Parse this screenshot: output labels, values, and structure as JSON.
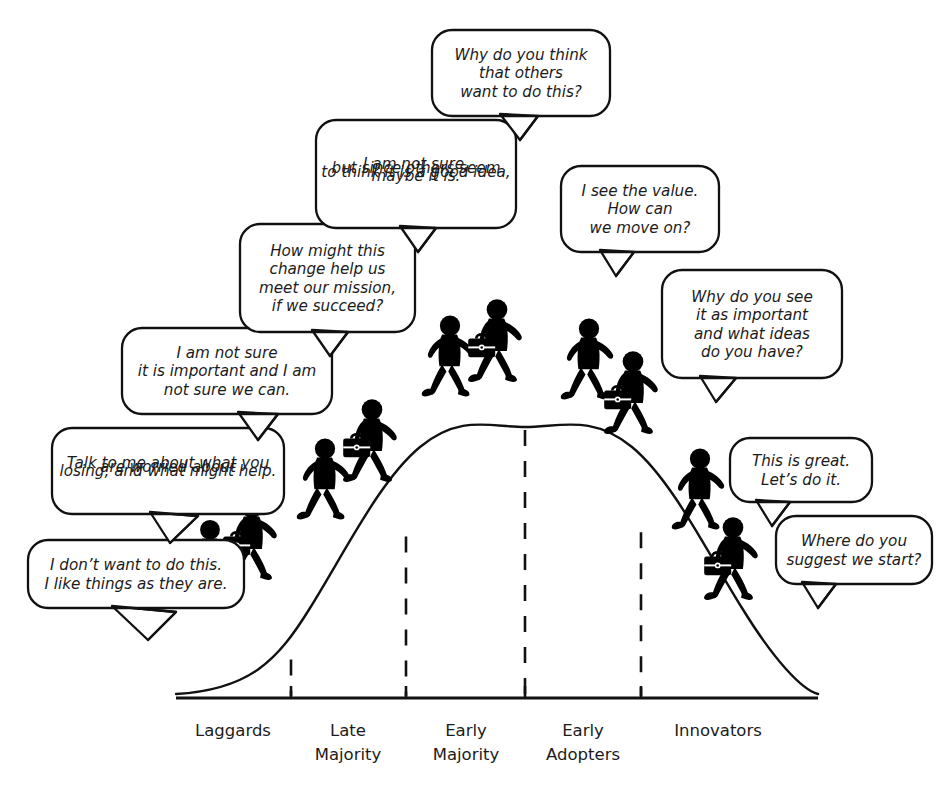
{
  "diagram": {
    "type": "bell-curve-annotated",
    "colors": {
      "background": "#ffffff",
      "ink": "#111111",
      "figure": "#000000",
      "bubble_fill": "#ffffff"
    }
  },
  "axis": {
    "categories": [
      {
        "id": "laggards",
        "line1": "Laggards",
        "line2": "",
        "x": 233
      },
      {
        "id": "late-majority",
        "line1": "Late",
        "line2": "Majority",
        "x": 348
      },
      {
        "id": "early-majority",
        "line1": "Early",
        "line2": "Majority",
        "x": 466
      },
      {
        "id": "early-adopters",
        "line1": "Early",
        "line2": "Adopters",
        "x": 583
      },
      {
        "id": "innovators",
        "line1": "Innovators",
        "line2": "",
        "x": 718
      }
    ],
    "dividers": [
      291,
      406,
      525,
      641
    ],
    "baseline_y": 698,
    "baseline_x_start": 176,
    "baseline_x_end": 818
  },
  "chart_data": {
    "type": "area",
    "xlabel": "",
    "ylabel": "",
    "categories": [
      "Laggards",
      "Late Majority",
      "Early Majority",
      "Early Adopters",
      "Innovators"
    ],
    "curve_peak": {
      "x": 525,
      "y": 427
    },
    "grid": false,
    "legend": "none",
    "note": "Normal distribution bell curve segmented by five adopter categories, read right-to-left from Innovators to Laggards."
  },
  "bubbles": [
    {
      "id": "laggard-resistance",
      "speaker": "laggard",
      "lines": [
        "I don’t want to do this.",
        "I like things as they are."
      ],
      "box": {
        "x": 28,
        "y": 540,
        "w": 216,
        "h": 68,
        "r": 20
      },
      "tail": [
        [
          112,
          606
        ],
        [
          176,
          612
        ],
        [
          148,
          640
        ]
      ]
    },
    {
      "id": "coach-talk-to-me",
      "speaker": "coach",
      "lines": [
        "Talk to me about what you",
        "are worried about",
        "losing, and what might help."
      ],
      "box": {
        "x": 52,
        "y": 428,
        "w": 232,
        "h": 86,
        "r": 20
      },
      "tail": [
        [
          150,
          512
        ],
        [
          198,
          516
        ],
        [
          170,
          543
        ]
      ]
    },
    {
      "id": "late-majority-doubt",
      "speaker": "late-majority",
      "lines": [
        "I am not sure",
        "it is important and I am",
        "not sure we can."
      ],
      "box": {
        "x": 122,
        "y": 328,
        "w": 210,
        "h": 86,
        "r": 20
      },
      "tail": [
        [
          238,
          412
        ],
        [
          278,
          414
        ],
        [
          258,
          440
        ]
      ]
    },
    {
      "id": "coach-how-might-this",
      "speaker": "coach",
      "lines": [
        "How might this",
        "change help us",
        "meet our mission,",
        "if we succeed?"
      ],
      "box": {
        "x": 240,
        "y": 224,
        "w": 175,
        "h": 108,
        "r": 20
      },
      "tail": [
        [
          312,
          330
        ],
        [
          348,
          332
        ],
        [
          330,
          356
        ]
      ]
    },
    {
      "id": "early-majority-maybe",
      "speaker": "early-majority",
      "lines": [
        "I am not sure,",
        "but since others seem",
        "to think it is a good idea,",
        "maybe it is."
      ],
      "box": {
        "x": 316,
        "y": 120,
        "w": 200,
        "h": 108,
        "r": 20
      },
      "tail": [
        [
          400,
          226
        ],
        [
          436,
          228
        ],
        [
          418,
          252
        ]
      ]
    },
    {
      "id": "coach-why-do-others",
      "speaker": "coach",
      "lines": [
        "Why do you think",
        "that others",
        "want to do this?"
      ],
      "box": {
        "x": 432,
        "y": 30,
        "w": 178,
        "h": 86,
        "r": 20
      },
      "tail": [
        [
          500,
          114
        ],
        [
          538,
          116
        ],
        [
          520,
          140
        ]
      ]
    },
    {
      "id": "early-adopter-value",
      "speaker": "early-adopter",
      "lines": [
        "I see the value.",
        "How can",
        "we move on?"
      ],
      "box": {
        "x": 561,
        "y": 166,
        "w": 158,
        "h": 86,
        "r": 20
      },
      "tail": [
        [
          600,
          250
        ],
        [
          634,
          252
        ],
        [
          616,
          276
        ]
      ]
    },
    {
      "id": "coach-why-important",
      "speaker": "coach",
      "lines": [
        "Why do you see",
        "it as important",
        "and what ideas",
        "do you have?"
      ],
      "box": {
        "x": 662,
        "y": 270,
        "w": 180,
        "h": 108,
        "r": 20
      },
      "tail": [
        [
          700,
          376
        ],
        [
          736,
          378
        ],
        [
          716,
          402
        ]
      ]
    },
    {
      "id": "innovator-great",
      "speaker": "innovator",
      "lines": [
        "This is great.",
        "Let’s do it."
      ],
      "box": {
        "x": 730,
        "y": 438,
        "w": 142,
        "h": 64,
        "r": 20
      },
      "tail": [
        [
          756,
          500
        ],
        [
          790,
          502
        ],
        [
          772,
          526
        ]
      ]
    },
    {
      "id": "coach-where-start",
      "speaker": "coach",
      "lines": [
        "Where do you",
        "suggest we start?"
      ],
      "box": {
        "x": 776,
        "y": 516,
        "w": 156,
        "h": 68,
        "r": 20
      },
      "tail": [
        [
          802,
          582
        ],
        [
          836,
          584
        ],
        [
          818,
          608
        ]
      ]
    }
  ],
  "figures": [
    {
      "id": "laggard-person",
      "role": "adopter-plain",
      "x": 210,
      "y": 578,
      "scale": 0.86,
      "rotate": 0,
      "briefcase": false
    },
    {
      "id": "laggard-coach",
      "role": "coach-briefcase",
      "x": 252,
      "y": 558,
      "scale": 0.9,
      "rotate": 0,
      "briefcase": true
    },
    {
      "id": "late-majority-person",
      "role": "adopter-plain",
      "x": 325,
      "y": 498,
      "scale": 0.88,
      "rotate": 0,
      "briefcase": false
    },
    {
      "id": "late-majority-coach",
      "role": "coach-briefcase",
      "x": 372,
      "y": 460,
      "scale": 0.9,
      "rotate": 0,
      "briefcase": true
    },
    {
      "id": "early-majority-person",
      "role": "adopter-plain",
      "x": 450,
      "y": 375,
      "scale": 0.88,
      "rotate": 0,
      "briefcase": false
    },
    {
      "id": "early-majority-coach",
      "role": "coach-briefcase",
      "x": 497,
      "y": 360,
      "scale": 0.9,
      "rotate": 0,
      "briefcase": true
    },
    {
      "id": "early-adopter-person",
      "role": "adopter-plain",
      "x": 589,
      "y": 378,
      "scale": 0.88,
      "rotate": 0,
      "briefcase": false
    },
    {
      "id": "early-adopter-coach",
      "role": "coach-briefcase",
      "x": 633,
      "y": 412,
      "scale": 0.9,
      "rotate": 0,
      "briefcase": true
    },
    {
      "id": "innovator-person",
      "role": "adopter-plain",
      "x": 700,
      "y": 508,
      "scale": 0.88,
      "rotate": 0,
      "briefcase": false
    },
    {
      "id": "innovator-coach",
      "role": "coach-briefcase",
      "x": 733,
      "y": 578,
      "scale": 0.9,
      "rotate": 0,
      "briefcase": true
    }
  ]
}
